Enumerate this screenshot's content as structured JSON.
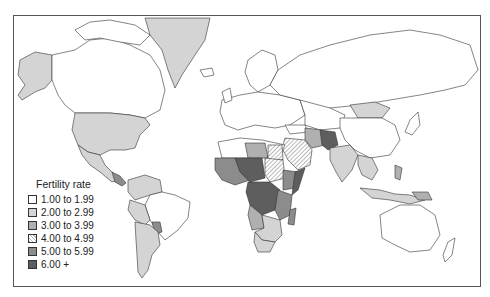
{
  "map": {
    "title": "Fertility rate",
    "legend": {
      "title": "Fertility rate",
      "items": [
        {
          "label": "1.00 to 1.99",
          "color": "#ffffff",
          "pattern": "solid"
        },
        {
          "label": "2.00 to 2.99",
          "color": "#d4d4d4",
          "pattern": "solid"
        },
        {
          "label": "3.00 to 3.99",
          "color": "#b0b0b0",
          "pattern": "solid"
        },
        {
          "label": "4.00 to 4.99",
          "color": "#bbbbbb",
          "pattern": "hatched"
        },
        {
          "label": "5.00 to 5.99",
          "color": "#8c8c8c",
          "pattern": "solid"
        },
        {
          "label": "6.00 +",
          "color": "#5e5e5e",
          "pattern": "solid"
        }
      ]
    }
  }
}
